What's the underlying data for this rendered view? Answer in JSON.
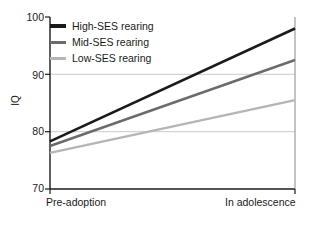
{
  "chart_data": {
    "type": "line",
    "title": "",
    "xlabel": "",
    "ylabel": "IQ",
    "categories": [
      "Pre-adoption",
      "In adolescence"
    ],
    "x": [
      0,
      1
    ],
    "ylim": [
      70,
      100
    ],
    "yticks": [
      70,
      80,
      90,
      100
    ],
    "ytick_labels": [
      "70",
      "80",
      "90",
      "100"
    ],
    "grid": "horizontal gridlines at 80 and 90 only",
    "legend_position": "top-left inside plot area",
    "series": [
      {
        "name": "High-SES rearing",
        "values": [
          78.3,
          98.0
        ],
        "color": "#1a1a1a",
        "width": 2.6
      },
      {
        "name": "Mid-SES rearing",
        "values": [
          77.5,
          92.5
        ],
        "color": "#6b6b6b",
        "width": 2.4
      },
      {
        "name": "Low-SES rearing",
        "values": [
          76.3,
          85.5
        ],
        "color": "#b5b5b5",
        "width": 2.4
      }
    ]
  },
  "axes": {
    "y_title": "IQ",
    "y_labels": [
      "100",
      "90",
      "80",
      "70"
    ],
    "x_labels": [
      "Pre-adoption",
      "In adolescence"
    ]
  },
  "legend": {
    "entries": [
      {
        "label": "High-SES rearing",
        "color": "#1a1a1a"
      },
      {
        "label": "Mid-SES rearing",
        "color": "#6b6b6b"
      },
      {
        "label": "Low-SES rearing",
        "color": "#b5b5b5"
      }
    ]
  },
  "colors": {
    "axis": "#1a1a1a",
    "gridline": "#c9c9c9",
    "background": "#ffffff",
    "high_ses": "#1a1a1a",
    "mid_ses": "#6b6b6b",
    "low_ses": "#b5b5b5"
  }
}
